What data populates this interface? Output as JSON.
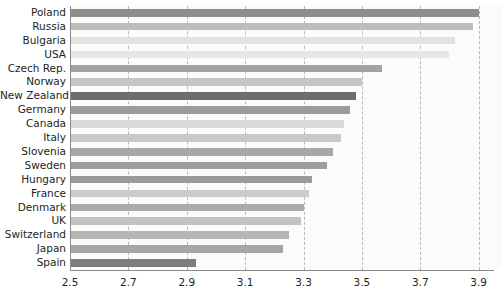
{
  "chart_data": {
    "type": "bar",
    "orientation": "horizontal",
    "title": "",
    "subtitle": "",
    "xlabel": "",
    "ylabel": "",
    "xlim": [
      2.5,
      3.98
    ],
    "xticks": [
      2.5,
      2.7,
      2.9,
      3.1,
      3.3,
      3.5,
      3.7,
      3.9
    ],
    "xtick_labels": [
      "2.5",
      "2.7",
      "2.9",
      "3.1",
      "3.3",
      "3.5",
      "3.7",
      "3.9"
    ],
    "grid": "vertical-dashed",
    "legend": "none",
    "categories": [
      "Poland",
      "Russia",
      "Bulgaria",
      "USA",
      "Czech Rep.",
      "Norway",
      "New Zealand",
      "Germany",
      "Canada",
      "Italy",
      "Slovenia",
      "Sweden",
      "Hungary",
      "France",
      "Denmark",
      "UK",
      "Switzerland",
      "Japan",
      "Spain"
    ],
    "values": [
      3.9,
      3.88,
      3.82,
      3.8,
      3.57,
      3.5,
      3.48,
      3.46,
      3.44,
      3.43,
      3.4,
      3.38,
      3.33,
      3.32,
      3.3,
      3.29,
      3.25,
      3.23,
      2.93
    ],
    "bar_colors": [
      "#8d8d8d",
      "#bdbdbd",
      "#e2e2e2",
      "#e6e6e6",
      "#a3a3a3",
      "#c6c6c6",
      "#6e6e6e",
      "#9b9b9b",
      "#d9d9d9",
      "#c9c9c9",
      "#a8a8a8",
      "#9e9e9e",
      "#9a9a9a",
      "#cccccc",
      "#ababab",
      "#c2c2c2",
      "#b5b5b5",
      "#a6a6a6",
      "#7d7d7d"
    ]
  },
  "axis": {
    "x_tick_color": "#231f20",
    "grid_color": "#b9b9b9",
    "axis_line_color": "#8a8a8a",
    "plot_background": "#fbfbfb"
  }
}
